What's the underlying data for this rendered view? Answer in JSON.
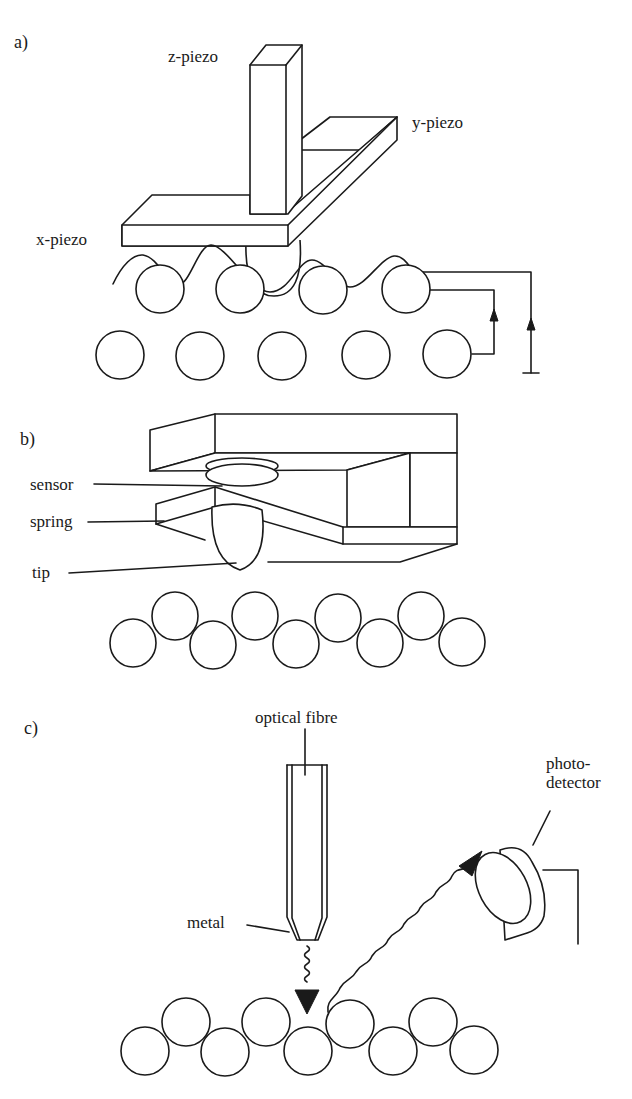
{
  "figure": {
    "panels": [
      {
        "id": "a",
        "label": "a)",
        "labels": {
          "z": "z-piezo",
          "y": "y-piezo",
          "x": "x-piezo"
        }
      },
      {
        "id": "b",
        "label": "b)",
        "labels": {
          "sensor": "sensor",
          "spring": "spring",
          "tip": "tip"
        }
      },
      {
        "id": "c",
        "label": "c)",
        "labels": {
          "fibre": "optical fibre",
          "detector_line1": "photo-",
          "detector_line2": "detector",
          "metal": "metal"
        }
      }
    ]
  }
}
